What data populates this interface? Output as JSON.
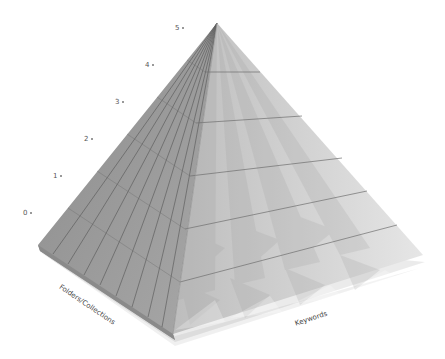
{
  "diagram": {
    "type": "pyramid",
    "levels": [
      {
        "label": "0",
        "x": 23,
        "y": 209
      },
      {
        "label": "1",
        "x": 53,
        "y": 172
      },
      {
        "label": "2",
        "x": 84,
        "y": 135
      },
      {
        "label": "3",
        "x": 115,
        "y": 98
      },
      {
        "label": "4",
        "x": 145,
        "y": 61
      },
      {
        "label": "5",
        "x": 175,
        "y": 24
      }
    ],
    "axes": {
      "left": "Folders/Collections",
      "right": "Keywords"
    },
    "colors": {
      "left_face": "#9a9a9a",
      "right_face": "#d6d6d6",
      "grid_line": "#5a5a5a",
      "label_text": "#555555"
    }
  }
}
